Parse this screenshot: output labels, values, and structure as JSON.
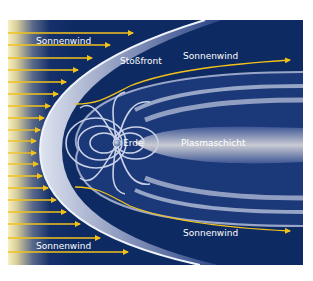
{
  "diagram": {
    "colors": {
      "background": "#0d2a63",
      "sun_glow": "#f4ecb0",
      "solar_wind_arrow": "#f2c21a",
      "field_line": "#c9cfe2",
      "plasma_sheet": "#b9b6a8"
    },
    "labels": {
      "solar_wind_top_left": "Sonnenwind",
      "bow_shock": "Stoßfront",
      "solar_wind_top_right": "Sonnenwind",
      "earth": "Erde",
      "plasma_sheet": "Plasmaschicht",
      "solar_wind_bottom_right": "Sonnenwind",
      "solar_wind_bottom_left": "Sonnenwind"
    },
    "solar_wind_arrow_count": 19
  }
}
